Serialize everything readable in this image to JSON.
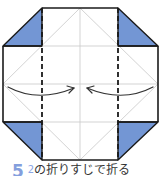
{
  "diagram": {
    "colors": {
      "paper": "#ffffff",
      "outline": "#1a1a1a",
      "crease": "#c8c8c8",
      "flap_fill": "#7396d4",
      "arrow": "#333333",
      "step_number": "#6f8fd8"
    },
    "fold_lines": [
      "left-valley-fold",
      "right-valley-fold"
    ],
    "arrows": [
      "left-arrow-to-center",
      "right-arrow-to-center"
    ]
  },
  "caption": {
    "step_number": "5",
    "crease_ref": "2",
    "instruction": "の折りすじで折る"
  }
}
